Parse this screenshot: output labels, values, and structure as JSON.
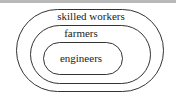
{
  "diagram": {
    "type": "nested-sets",
    "sets": [
      {
        "label": "skilled workers",
        "level": "outer"
      },
      {
        "label": "farmers",
        "level": "middle"
      },
      {
        "label": "engineers",
        "level": "inner"
      }
    ]
  },
  "colors": {
    "stroke": "#333333",
    "background": "#ffffff",
    "top_rule": "#b8b8b8"
  }
}
